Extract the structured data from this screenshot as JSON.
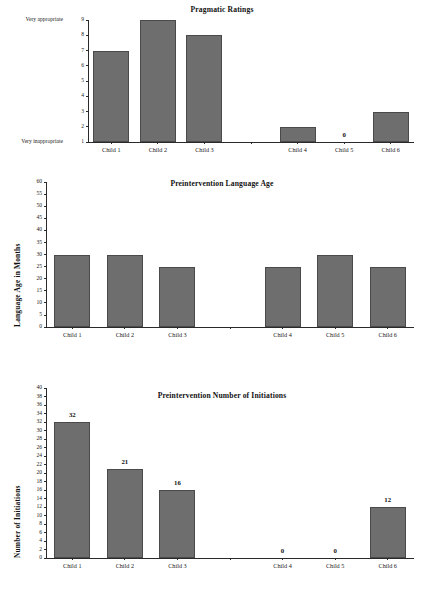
{
  "figure": {
    "background_color": "#ffffff",
    "bar_color": "#6e6e6e",
    "bar_edge_color": "#4a4a4a",
    "axis_color": "#2a2a2a"
  },
  "charts": [
    {
      "id": "pragmatic-ratings",
      "title": "Pragmatic Ratings",
      "ylabel": "",
      "y_min_caption": "Very inappropriate",
      "y_max_caption": "Very appropriate",
      "categories": [
        "Child 1",
        "Child 2",
        "Child 3",
        "",
        "Child 4",
        "Child 5",
        "Child 6"
      ],
      "values": [
        7,
        9,
        8,
        null,
        2,
        1,
        3
      ],
      "value_labels": [
        "",
        "",
        "",
        "",
        "",
        "0",
        ""
      ],
      "yticks": [
        1,
        2,
        3,
        4,
        5,
        6,
        7,
        8,
        9
      ],
      "ylim": [
        1,
        9
      ]
    },
    {
      "id": "preintervention-language-age",
      "title": "Preintervention Language Age",
      "ylabel": "Language Age in Months",
      "categories": [
        "Child 1",
        "Child 2",
        "Child 3",
        "",
        "Child 4",
        "Child 5",
        "Child 6"
      ],
      "values": [
        30,
        30,
        25,
        null,
        25,
        30,
        25
      ],
      "value_labels": [
        "",
        "",
        "",
        "",
        "",
        "",
        ""
      ],
      "yticks": [
        0,
        5,
        10,
        15,
        20,
        25,
        30,
        35,
        40,
        45,
        50,
        55,
        60
      ],
      "ylim": [
        0,
        60
      ]
    },
    {
      "id": "preintervention-number-of-initiations",
      "title": "Preintervention Number of Initiations",
      "ylabel": "Number of Initiations",
      "categories": [
        "Child 1",
        "Child 2",
        "Child 3",
        "",
        "Child 4",
        "Child 5",
        "Child 6"
      ],
      "values": [
        32,
        21,
        16,
        null,
        0,
        0,
        12
      ],
      "value_labels": [
        "32",
        "21",
        "16",
        "",
        "0",
        "0",
        "12"
      ],
      "yticks": [
        0,
        2,
        4,
        6,
        8,
        10,
        12,
        14,
        16,
        18,
        20,
        22,
        24,
        26,
        28,
        30,
        32,
        34,
        36,
        38,
        40
      ],
      "ylim": [
        0,
        40
      ]
    }
  ],
  "chart_data": [
    {
      "type": "bar",
      "title": "Pragmatic Ratings",
      "xlabel": "",
      "ylabel": "",
      "categories": [
        "Child 1",
        "Child 2",
        "Child 3",
        "Child 4",
        "Child 5",
        "Child 6"
      ],
      "values": [
        7,
        9,
        8,
        2,
        0,
        3
      ],
      "ylim": [
        1,
        9
      ],
      "yticks": [
        1,
        2,
        3,
        4,
        5,
        6,
        7,
        8,
        9
      ],
      "ytick_annotations": {
        "1": "Very inappropriate",
        "9": "Very appropriate"
      },
      "annotations": [
        {
          "category": "Child 5",
          "text": "0"
        }
      ],
      "grid": false,
      "legend": "none"
    },
    {
      "type": "bar",
      "title": "Preintervention Language Age",
      "xlabel": "",
      "ylabel": "Language Age in Months",
      "categories": [
        "Child 1",
        "Child 2",
        "Child 3",
        "Child 4",
        "Child 5",
        "Child 6"
      ],
      "values": [
        30,
        30,
        25,
        25,
        30,
        25
      ],
      "ylim": [
        0,
        60
      ],
      "yticks": [
        0,
        5,
        10,
        15,
        20,
        25,
        30,
        35,
        40,
        45,
        50,
        55,
        60
      ],
      "grid": false,
      "legend": "none"
    },
    {
      "type": "bar",
      "title": "Preintervention Number of Initiations",
      "xlabel": "",
      "ylabel": "Number of Initiations",
      "categories": [
        "Child 1",
        "Child 2",
        "Child 3",
        "Child 4",
        "Child 5",
        "Child 6"
      ],
      "values": [
        32,
        21,
        16,
        0,
        0,
        12
      ],
      "data_labels": [
        "32",
        "21",
        "16",
        "0",
        "0",
        "12"
      ],
      "ylim": [
        0,
        40
      ],
      "yticks": [
        0,
        2,
        4,
        6,
        8,
        10,
        12,
        14,
        16,
        18,
        20,
        22,
        24,
        26,
        28,
        30,
        32,
        34,
        36,
        38,
        40
      ],
      "grid": false,
      "legend": "none"
    }
  ]
}
